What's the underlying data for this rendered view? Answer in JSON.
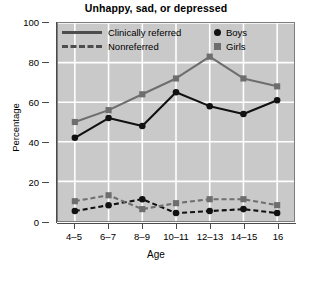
{
  "chart_data": {
    "type": "line",
    "title": "Unhappy, sad, or depressed",
    "xlabel": "Age",
    "ylabel": "Percentage",
    "categories": [
      "4–5",
      "6–7",
      "8–9",
      "10–11",
      "12–13",
      "14–15",
      "16"
    ],
    "ylim": [
      0,
      100
    ],
    "yticks": [
      0,
      20,
      40,
      60,
      80,
      100
    ],
    "grid": true,
    "legend_position": "top-inside",
    "legend": [
      {
        "label": "Clinically referred",
        "style": "solid"
      },
      {
        "label": "Nonreferred",
        "style": "dashed"
      },
      {
        "label": "Boys",
        "marker": "circle",
        "color": "#111111"
      },
      {
        "label": "Girls",
        "marker": "square",
        "color": "#6e6e6e"
      }
    ],
    "series": [
      {
        "name": "Clinically referred — Boys",
        "group": "Clinically referred",
        "sex": "Boys",
        "style": "solid",
        "marker": "circle",
        "color": "#111111",
        "values": [
          42,
          52,
          48,
          65,
          58,
          54,
          61
        ]
      },
      {
        "name": "Clinically referred — Girls",
        "group": "Clinically referred",
        "sex": "Girls",
        "style": "solid",
        "marker": "square",
        "color": "#6e6e6e",
        "values": [
          50,
          56,
          64,
          72,
          83,
          72,
          68
        ]
      },
      {
        "name": "Nonreferred — Boys",
        "group": "Nonreferred",
        "sex": "Boys",
        "style": "dashed",
        "marker": "circle",
        "color": "#111111",
        "values": [
          5,
          8,
          11,
          4,
          5,
          6,
          4
        ]
      },
      {
        "name": "Nonreferred — Girls",
        "group": "Nonreferred",
        "sex": "Girls",
        "style": "dashed",
        "marker": "square",
        "color": "#6e6e6e",
        "values": [
          10,
          13,
          6,
          9,
          11,
          11,
          8
        ]
      }
    ]
  },
  "colors": {
    "plot_background": "#c9c9c9",
    "grid_line": "#ffffff",
    "axis": "#4a4a4a",
    "boys": "#111111",
    "girls": "#6e6e6e",
    "page_background": "#ffffff"
  }
}
